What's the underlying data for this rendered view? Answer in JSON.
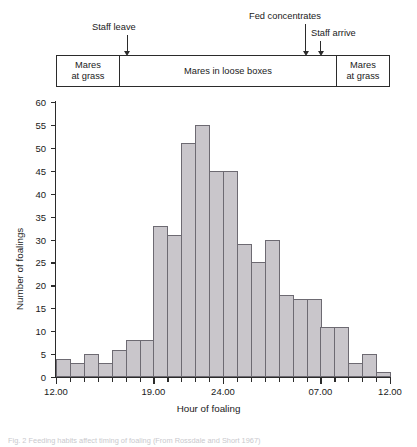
{
  "timeline": {
    "segments": [
      {
        "label": "Mares\nat grass",
        "name": "mares-at-grass-left"
      },
      {
        "label": "Mares in loose boxes",
        "name": "mares-in-loose-boxes"
      },
      {
        "label": "Mares\nat grass",
        "name": "mares-at-grass-right"
      }
    ],
    "annotations": [
      {
        "label": "Staff leave",
        "hour": 17.1
      },
      {
        "label": "Fed concentrates",
        "hour": 29.9
      },
      {
        "label": "Staff arrive",
        "hour": 31.0
      }
    ]
  },
  "chart_data": {
    "type": "bar",
    "title": "",
    "xlabel": "Hour of foaling",
    "ylabel": "Number of foalings",
    "ylim": [
      0,
      60
    ],
    "ytick_step": 5,
    "xlim": [
      12,
      36
    ],
    "xticks": [
      12,
      19,
      24,
      31,
      36
    ],
    "xtick_labels": [
      "12.00",
      "19.00",
      "24.00",
      "07.00",
      "12.00"
    ],
    "bin_width_hours": 1,
    "grid": false,
    "legend": null,
    "bar_fill": "#c9c6cb",
    "bar_stroke": "#6d6a72",
    "categories": [
      "12.00",
      "13.00",
      "14.00",
      "15.00",
      "16.00",
      "17.00",
      "18.00",
      "19.00",
      "20.00",
      "21.00",
      "22.00",
      "23.00",
      "24.00",
      "01.00",
      "02.00",
      "03.00",
      "04.00",
      "05.00",
      "06.00",
      "07.00",
      "08.00",
      "09.00",
      "10.00",
      "11.00"
    ],
    "values": [
      4,
      3,
      5,
      3,
      6,
      8,
      8,
      33,
      31,
      51,
      55,
      45,
      45,
      29,
      25,
      30,
      18,
      17,
      17,
      11,
      11,
      3,
      5,
      1
    ]
  },
  "caption": "Fig. 2 Feeding habits affect timing of foaling (From Rossdale and Short 1967)"
}
